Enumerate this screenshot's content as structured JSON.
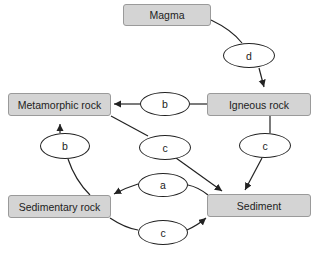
{
  "diagram": {
    "type": "rock-cycle",
    "nodes": {
      "magma": "Magma",
      "metamorphic": "Metamorphic rock",
      "igneous": "Igneous rock",
      "sedimentary": "Sedimentary rock",
      "sediment": "Sediment"
    },
    "processes": {
      "magma_to_igneous": "d",
      "igneous_to_metamorphic": "b",
      "sedimentary_to_metamorphic": "b",
      "metamorphic_to_sediment": "c",
      "igneous_to_sediment": "c",
      "sediment_to_sedimentary": "a",
      "sedimentary_to_sediment": "c"
    },
    "colors": {
      "box_fill": "#d4d4d4",
      "box_border": "#9a9a9a",
      "line": "#222222"
    }
  }
}
